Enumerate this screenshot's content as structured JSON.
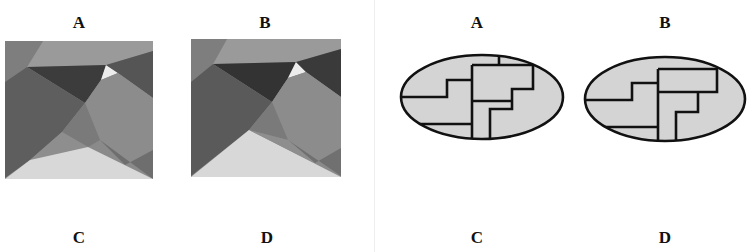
{
  "left_panel": {
    "labels": {
      "top_left": "A",
      "top_right": "B",
      "bottom_left": "C",
      "bottom_right": "D"
    },
    "figures": [
      {
        "id": "A",
        "type": "grayscale-polygon-mosaic"
      },
      {
        "id": "B",
        "type": "grayscale-polygon-mosaic"
      }
    ]
  },
  "right_panel": {
    "labels": {
      "top_left": "A",
      "top_right": "B",
      "bottom_left": "C",
      "bottom_right": "D"
    },
    "figures": [
      {
        "id": "A",
        "type": "ellipse-partition"
      },
      {
        "id": "B",
        "type": "ellipse-partition"
      }
    ]
  },
  "colors": {
    "ellipse_fill": "#d4d4d4",
    "stroke": "#111111",
    "gray_darkest": "#3a3a3a",
    "gray_dark": "#5a5a5a",
    "gray_mid": "#808080",
    "gray_light": "#9a9a9a",
    "gray_lightest": "#d8d8d8",
    "white": "#f4f4f4"
  }
}
